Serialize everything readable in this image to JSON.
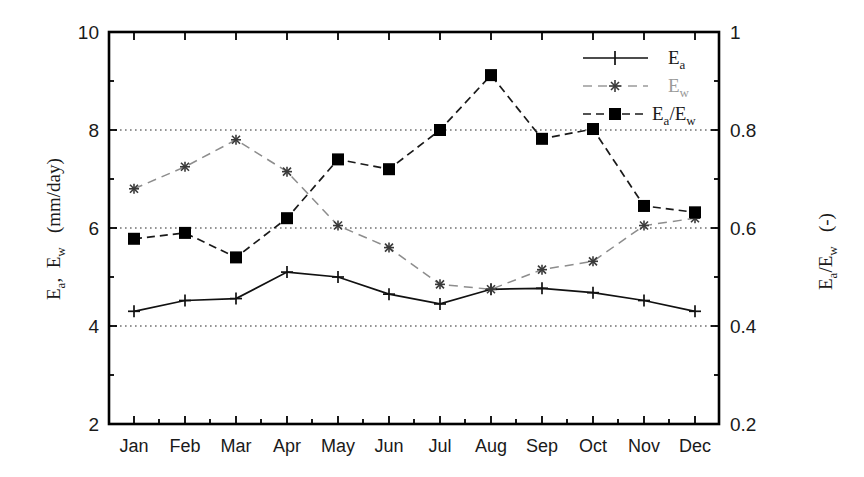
{
  "chart_data": {
    "type": "line",
    "title": "",
    "xlabel": "",
    "categories": [
      "Jan",
      "Feb",
      "Mar",
      "Apr",
      "May",
      "Jun",
      "Jul",
      "Aug",
      "Sep",
      "Oct",
      "Nov",
      "Dec"
    ],
    "left_axis": {
      "label": "E_a ,  E_w   (mm/day)",
      "label_parts": {
        "p1": "E",
        "p1sub": "a",
        "p2": ",",
        "p3": "E",
        "p3sub": "w",
        "p4": "(mm/day)"
      },
      "ylim": [
        2,
        10
      ],
      "ticks": [
        "2",
        "4",
        "6",
        "8",
        "10"
      ],
      "tick_values": [
        2,
        4,
        6,
        8,
        10
      ]
    },
    "right_axis": {
      "label": "E_a/E_w   (-)",
      "label_parts": {
        "p1": "E",
        "p1sub": "a",
        "p2": "/E",
        "p2sub": "w",
        "p3": "(-)"
      },
      "ylim": [
        0.2,
        1
      ],
      "ticks": [
        "0.2",
        "0.4",
        "0.6",
        "0.8",
        "1"
      ],
      "tick_values": [
        0.2,
        0.4,
        0.6,
        0.8,
        1.0
      ]
    },
    "grid": "horizontal dotted gridlines at 4, 6, 8 (left axis)",
    "gridline_values": [
      4,
      6,
      8
    ],
    "legend_position": "top-right inside plot",
    "series": [
      {
        "name": "Ea",
        "legend_label": "E",
        "legend_sub": "a",
        "axis": "left",
        "marker": "plus",
        "linestyle": "solid",
        "color": "#111111",
        "values": [
          4.3,
          4.52,
          4.56,
          5.1,
          5.0,
          4.65,
          4.45,
          4.75,
          4.77,
          4.68,
          4.52,
          4.3
        ]
      },
      {
        "name": "Ew",
        "legend_label": "E",
        "legend_sub": "w",
        "axis": "left",
        "marker": "star",
        "linestyle": "dashed",
        "color": "#8d8d8d",
        "values": [
          6.8,
          7.25,
          7.8,
          7.15,
          6.05,
          5.6,
          4.85,
          4.75,
          5.15,
          5.32,
          6.05,
          6.2
        ]
      },
      {
        "name": "Ea/Ew",
        "legend_label": "E",
        "legend_sub": "a",
        "legend_label2": "/E",
        "legend_sub2": "w",
        "axis": "right",
        "marker": "filled-square",
        "linestyle": "dashed",
        "color": "#1a1a1a",
        "values_right_axis": [
          0.578,
          0.59,
          0.54,
          0.62,
          0.74,
          0.72,
          0.8,
          0.912,
          0.782,
          0.802,
          0.645,
          0.632
        ],
        "values_left_equivalent": [
          5.78,
          5.9,
          5.4,
          6.2,
          7.4,
          7.2,
          8.0,
          9.12,
          7.82,
          8.02,
          6.45,
          6.32
        ]
      }
    ]
  }
}
